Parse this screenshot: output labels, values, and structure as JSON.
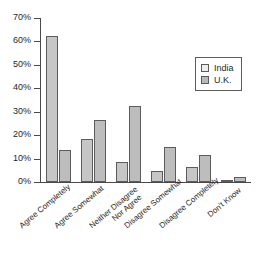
{
  "chart_data": {
    "type": "bar",
    "title": "",
    "subtitle": "",
    "xlabel": "",
    "ylabel": "",
    "ylim": [
      0,
      70
    ],
    "ytick_values": [
      0,
      10,
      20,
      30,
      40,
      50,
      60,
      70
    ],
    "ytick_labels": [
      "0%",
      "10%",
      "20%",
      "30%",
      "40%",
      "50%",
      "60%",
      "70%"
    ],
    "grid": false,
    "legend_position": "top-right",
    "categories": [
      "Agree Completely",
      "Agree Somewhat",
      "Neither Disagree Nor Agree",
      "Disagree Somewhat",
      "Disagree Completely",
      "Don't Know"
    ],
    "category_lines": [
      [
        "Agree Completely"
      ],
      [
        "Agree Somewhat"
      ],
      [
        "Neither Disagree",
        "Nor Agree"
      ],
      [
        "Disagree Somewhat"
      ],
      [
        "Disagree Completely"
      ],
      [
        "Don't Know"
      ]
    ],
    "series": [
      {
        "name": "India",
        "color": "#c6c6c6",
        "values": [
          62.5,
          18.5,
          8.5,
          4.5,
          6.5,
          1
        ]
      },
      {
        "name": "U.K.",
        "color": "#bdbdbd",
        "values": [
          13.5,
          26.5,
          32.5,
          15,
          11.5,
          2
        ]
      }
    ]
  },
  "legend": {
    "entries": [
      {
        "label": "India",
        "swatch": "legend-swatch-india"
      },
      {
        "label": "U.K.",
        "swatch": "legend-swatch-uk"
      }
    ]
  },
  "colors": {
    "axis": "#4a4a4a",
    "bar_border": "#5c5c5c",
    "india_fill": "#c6c6c6",
    "uk_fill": "#bdbdbd",
    "text": "#1f1f1f",
    "background": "#ffffff"
  }
}
